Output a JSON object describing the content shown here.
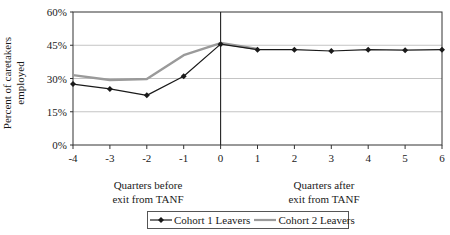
{
  "chart_data": {
    "type": "line",
    "title": "",
    "ylabel": "Percent of caretakers employed",
    "ylabel_lines": [
      "Percent of  caretakers",
      "employed"
    ],
    "xlabel_groups": [
      {
        "lines": [
          "Quarters before",
          "exit from TANF"
        ]
      },
      {
        "lines": [
          "Quarters after",
          "exit from TANF"
        ]
      }
    ],
    "x": [
      -4,
      -3,
      -2,
      -1,
      0,
      1,
      2,
      3,
      4,
      5,
      6
    ],
    "x_tick_labels": [
      "-4",
      "-3",
      "-2",
      "-1",
      "0",
      "1",
      "2",
      "3",
      "4",
      "5",
      "6"
    ],
    "y_tick_labels": [
      "0%",
      "15%",
      "30%",
      "45%",
      "60%"
    ],
    "y_ticks": [
      0,
      15,
      30,
      45,
      60
    ],
    "ylim": [
      0,
      60
    ],
    "grid": true,
    "vertical_reference_line_at_x": 0,
    "legend_position": "bottom",
    "series": [
      {
        "name": "Cohort 1 Leavers",
        "color": "#1a1a1a",
        "marker": "diamond",
        "x": [
          -4,
          -3,
          -2,
          -1,
          0,
          1,
          2,
          3,
          4,
          5,
          6
        ],
        "values": [
          27.5,
          25.3,
          22.4,
          31.0,
          45.5,
          43.0,
          43.0,
          42.4,
          43.0,
          42.8,
          43.0
        ]
      },
      {
        "name": "Cohort 2 Leavers",
        "color": "#9a9a9a",
        "marker": "none",
        "x": [
          -4,
          -3,
          -2,
          -1,
          0,
          1
        ],
        "values": [
          31.5,
          29.3,
          29.8,
          40.5,
          46.0,
          43.3
        ]
      }
    ]
  },
  "legend": {
    "items": [
      {
        "label": "Cohort 1 Leavers"
      },
      {
        "label": "Cohort 2 Leavers"
      }
    ]
  }
}
